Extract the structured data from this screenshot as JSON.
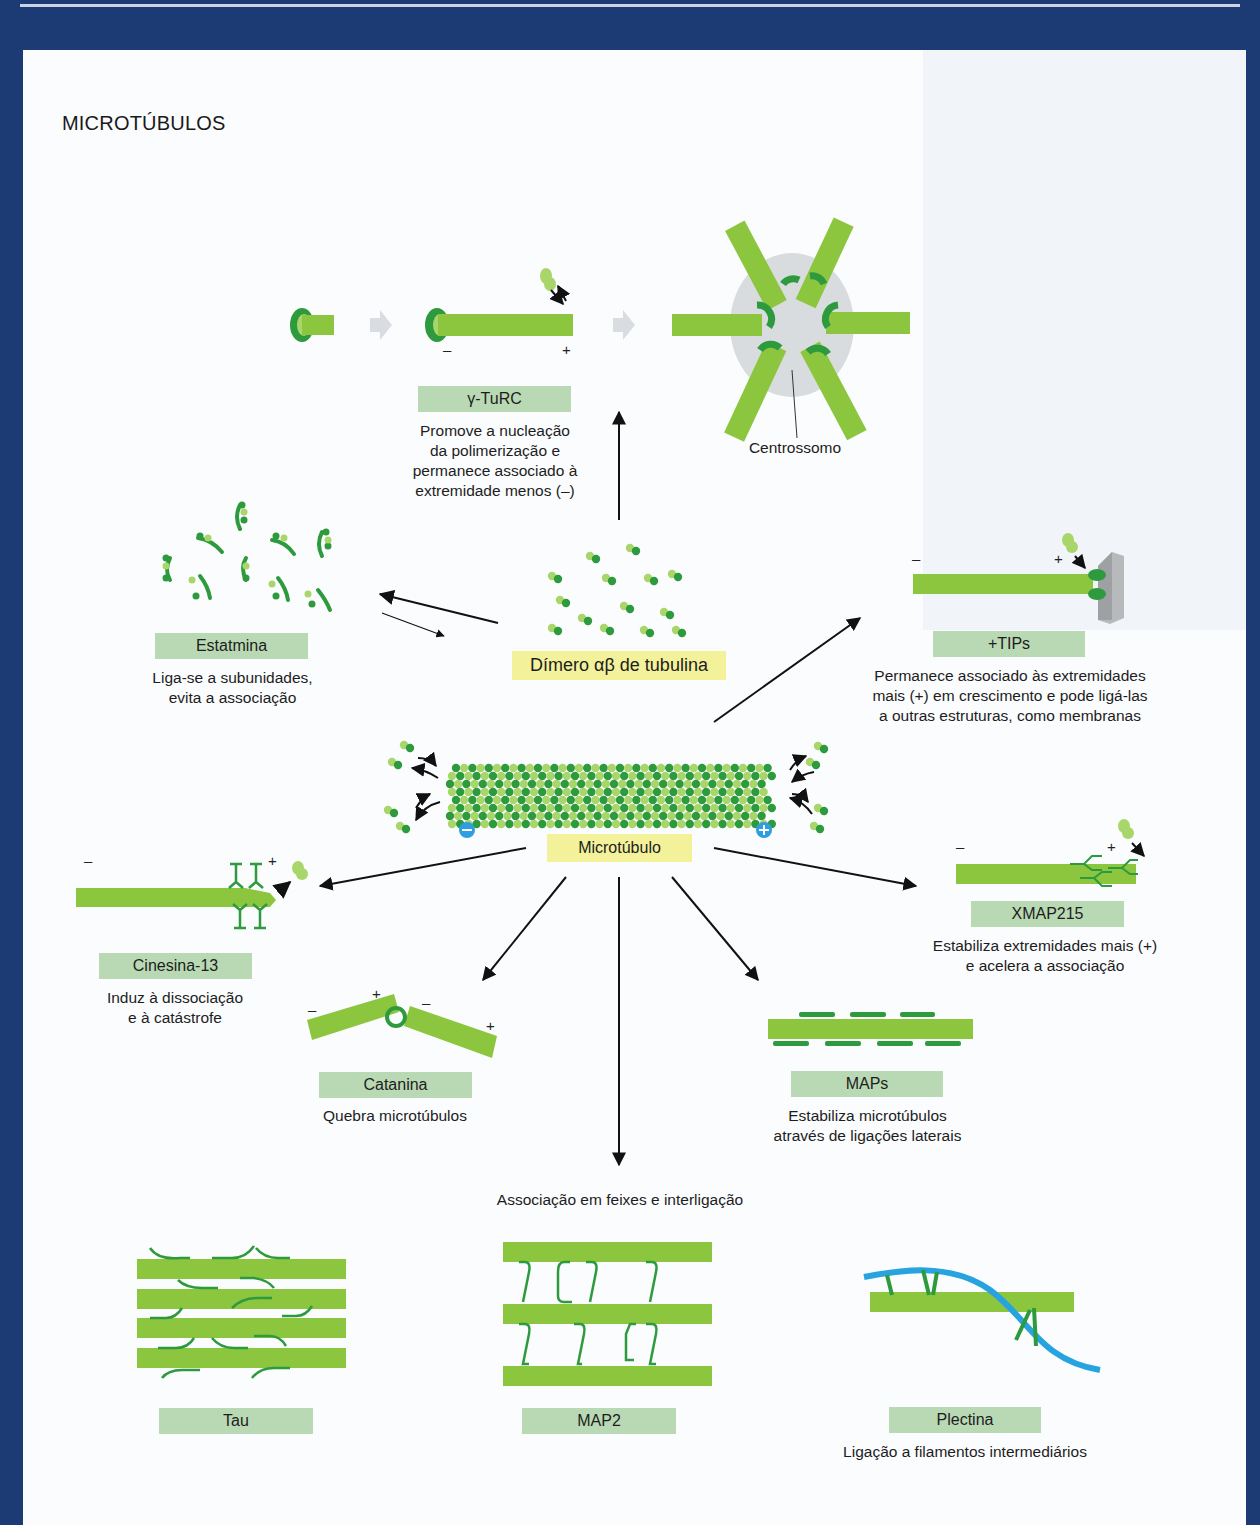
{
  "header": {
    "title": "MICROTÚBULOS"
  },
  "colors": {
    "frame": "#1c3a74",
    "tube": "#8cc63f",
    "tube_dark": "#2e9a3e",
    "label_bg": "#b9d9b4",
    "highlight_bg": "#f3f29b",
    "plus_minus_badge": "#2f9ee0",
    "intermediate_filament": "#27a3e0"
  },
  "center": {
    "dimer_label": "Dímero αβ de tubulina",
    "microtubule_label": "Microtúbulo",
    "minus_badge": "−",
    "plus_badge": "+"
  },
  "nucleation": {
    "label": "γ-TuRC",
    "description": "Promove a nucleação\nda polimerização e\npermanece  associado à\nextremidade menos (–)",
    "minus": "–",
    "plus": "+",
    "centrosome_label": "Centrossomo"
  },
  "proteins": [
    {
      "id": "estatmina",
      "label": "Estatmina",
      "description": "Liga-se a subunidades,\nevita a associação"
    },
    {
      "id": "tips",
      "label": "+TIPs",
      "description": "Permanece associado às extremidades\nmais (+) em crescimento e pode ligá-las\na outras estruturas, como membranas",
      "minus": "–",
      "plus": "+"
    },
    {
      "id": "cinesina",
      "label": "Cinesina-13",
      "description": "Induz à dissociação\ne à catástrofe",
      "minus": "–",
      "plus": "+"
    },
    {
      "id": "xmap215",
      "label": "XMAP215",
      "description": "Estabiliza extremidades mais (+)\ne acelera a associação",
      "minus": "–",
      "plus": "+"
    },
    {
      "id": "catanina",
      "label": "Catanina",
      "description": "Quebra microtúbulos",
      "signs": [
        "–",
        "+",
        "–",
        "+"
      ]
    },
    {
      "id": "maps",
      "label": "MAPs",
      "description": "Estabiliza microtúbulos\natravés de ligações laterais"
    }
  ],
  "bundling": {
    "heading": "Associação em feixes e interligação",
    "items": [
      {
        "id": "tau",
        "label": "Tau"
      },
      {
        "id": "map2",
        "label": "MAP2"
      },
      {
        "id": "plectina",
        "label": "Plectina",
        "description": "Ligação a filamentos intermediários"
      }
    ]
  }
}
